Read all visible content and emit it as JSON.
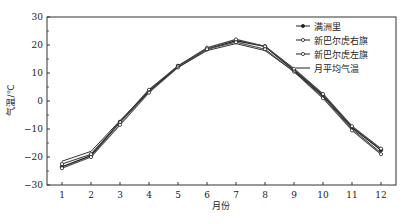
{
  "chart_data": {
    "type": "line",
    "title": "",
    "xlabel": "月份",
    "ylabel": "气温/℃",
    "x": [
      1,
      2,
      3,
      4,
      5,
      6,
      7,
      8,
      9,
      10,
      11,
      12
    ],
    "xticks": [
      "1",
      "2",
      "3",
      "4",
      "5",
      "6",
      "7",
      "8",
      "9",
      "10",
      "11",
      "12"
    ],
    "yticks": [
      "-30",
      "-20",
      "-10",
      "0",
      "10",
      "20",
      "30"
    ],
    "ylim": [
      -30,
      30
    ],
    "xlim": [
      0.7,
      12.4
    ],
    "grid": false,
    "legend_position": "upper right",
    "series": [
      {
        "name": "满洲里",
        "marker": "dot",
        "values": [
          -23.5,
          -19.5,
          -7.5,
          3.5,
          12.5,
          18.5,
          21.5,
          19.5,
          11,
          2,
          -9.5,
          -17.5
        ]
      },
      {
        "name": "新巴尔虎右旗",
        "marker": "dot-open",
        "values": [
          -22.5,
          -19,
          -7.5,
          4,
          12.5,
          19,
          22,
          19.5,
          11.5,
          2.5,
          -9,
          -17
        ]
      },
      {
        "name": "新巴尔虎左旗",
        "marker": "open-circle",
        "values": [
          -24,
          -20,
          -8.5,
          3,
          12,
          18.5,
          21,
          18.5,
          10.5,
          1,
          -10.5,
          -19
        ]
      },
      {
        "name": "月平均气温",
        "marker": "none",
        "values": [
          -21.5,
          -18,
          -7,
          3.5,
          12,
          18,
          20.5,
          18,
          10.5,
          1.5,
          -10,
          -18.5
        ]
      }
    ]
  },
  "axis": {
    "xlabel": "月份",
    "ylabel": "气温/℃"
  }
}
